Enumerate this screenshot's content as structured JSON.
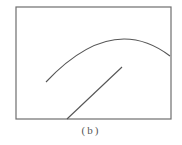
{
  "figure": {
    "caption": "(b)",
    "colors": {
      "frame": "#6e6e6e",
      "curve": "#555555",
      "line": "#555555",
      "caption": "#555555"
    },
    "frame": {
      "x": 16,
      "y": 7,
      "width": 155,
      "height": 112
    },
    "arc": {
      "start": [
        46,
        82
      ],
      "control": [
        112,
        12
      ],
      "end": [
        170,
        56
      ]
    },
    "segment": {
      "start": [
        67,
        119
      ],
      "end": [
        122,
        67
      ]
    }
  }
}
